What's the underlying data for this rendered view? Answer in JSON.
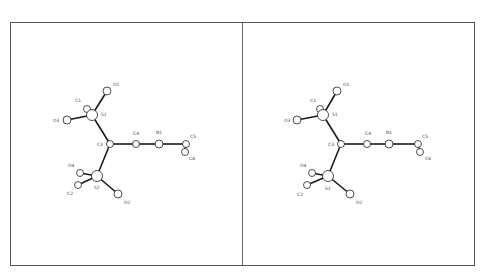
{
  "figure": {
    "type": "stereo-pair molecular structure (ball-and-stick)",
    "panels": [
      "left",
      "right"
    ],
    "colors": {
      "bond": "#1a1a1a",
      "atom_fill": "#ffffff",
      "atom_stroke": "#222222",
      "frame": "#555555"
    }
  },
  "atoms_left": [
    {
      "id": "O1",
      "x": 107,
      "y": 91,
      "r": 4,
      "lx": 113,
      "ly": 86
    },
    {
      "id": "C1",
      "x": 87,
      "y": 109,
      "r": 3.5,
      "lx": 75,
      "ly": 102
    },
    {
      "id": "S1",
      "x": 92,
      "y": 115,
      "r": 5.5,
      "lx": 101,
      "ly": 116
    },
    {
      "id": "O3",
      "x": 67,
      "y": 120,
      "r": 4,
      "lx": 53,
      "ly": 122
    },
    {
      "id": "C3",
      "x": 110,
      "y": 144,
      "r": 3.5,
      "lx": 97,
      "ly": 146
    },
    {
      "id": "C4",
      "x": 136,
      "y": 144,
      "r": 3.5,
      "lx": 133,
      "ly": 135
    },
    {
      "id": "N1",
      "x": 159,
      "y": 144,
      "r": 4,
      "lx": 156,
      "ly": 134
    },
    {
      "id": "C5",
      "x": 186,
      "y": 144,
      "r": 3.5,
      "lx": 190,
      "ly": 138
    },
    {
      "id": "C6",
      "x": 185,
      "y": 152,
      "r": 3.5,
      "lx": 189,
      "ly": 160
    },
    {
      "id": "O4",
      "x": 80,
      "y": 173,
      "r": 3.5,
      "lx": 68,
      "ly": 167
    },
    {
      "id": "C2",
      "x": 78,
      "y": 185,
      "r": 3.5,
      "lx": 67,
      "ly": 195
    },
    {
      "id": "S2",
      "x": 97,
      "y": 176,
      "r": 5.5,
      "lx": 94,
      "ly": 189
    },
    {
      "id": "O2",
      "x": 118,
      "y": 194,
      "r": 4,
      "lx": 124,
      "ly": 204
    }
  ],
  "atoms_right": [
    {
      "id": "O1",
      "x": 337,
      "y": 91,
      "r": 4,
      "lx": 343,
      "ly": 86
    },
    {
      "id": "C1",
      "x": 320,
      "y": 109,
      "r": 3.5,
      "lx": 310,
      "ly": 102
    },
    {
      "id": "S1",
      "x": 323,
      "y": 115,
      "r": 5.5,
      "lx": 332,
      "ly": 116
    },
    {
      "id": "O3",
      "x": 297,
      "y": 120,
      "r": 4,
      "lx": 284,
      "ly": 122
    },
    {
      "id": "C3",
      "x": 341,
      "y": 144,
      "r": 3.5,
      "lx": 328,
      "ly": 146
    },
    {
      "id": "C4",
      "x": 367,
      "y": 144,
      "r": 3.5,
      "lx": 365,
      "ly": 135
    },
    {
      "id": "N1",
      "x": 389,
      "y": 144,
      "r": 4,
      "lx": 386,
      "ly": 134
    },
    {
      "id": "C5",
      "x": 418,
      "y": 144,
      "r": 3.5,
      "lx": 422,
      "ly": 138
    },
    {
      "id": "C6",
      "x": 420,
      "y": 152,
      "r": 3.5,
      "lx": 425,
      "ly": 160
    },
    {
      "id": "O4",
      "x": 312,
      "y": 173,
      "r": 3.5,
      "lx": 300,
      "ly": 167
    },
    {
      "id": "C2",
      "x": 307,
      "y": 185,
      "r": 3.5,
      "lx": 297,
      "ly": 196
    },
    {
      "id": "S2",
      "x": 328,
      "y": 176,
      "r": 5.5,
      "lx": 325,
      "ly": 190
    },
    {
      "id": "O2",
      "x": 350,
      "y": 194,
      "r": 4,
      "lx": 356,
      "ly": 204
    }
  ],
  "bonds": [
    [
      "S1",
      "O1"
    ],
    [
      "S1",
      "C1"
    ],
    [
      "S1",
      "O3"
    ],
    [
      "S1",
      "C3"
    ],
    [
      "C3",
      "C4"
    ],
    [
      "C4",
      "N1"
    ],
    [
      "N1",
      "C5"
    ],
    [
      "C5",
      "C6"
    ],
    [
      "C3",
      "S2"
    ],
    [
      "S2",
      "O4"
    ],
    [
      "S2",
      "C2"
    ],
    [
      "S2",
      "O2"
    ]
  ]
}
